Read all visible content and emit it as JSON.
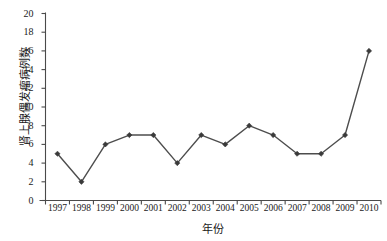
{
  "chart_data": {
    "type": "line",
    "title": "",
    "xlabel": "年份",
    "ylabel": "肾上腺偶发瘤病例数",
    "categories": [
      "1997",
      "1998",
      "1999",
      "2000",
      "2001",
      "2002",
      "2003",
      "2004",
      "2005",
      "2006",
      "2007",
      "2008",
      "2009",
      "2010"
    ],
    "values": [
      5,
      2,
      6,
      7,
      7,
      4,
      7,
      6,
      8,
      7,
      5,
      5,
      7,
      16
    ],
    "series": [
      {
        "name": "肾上腺偶发瘤病例数",
        "values": [
          5,
          2,
          6,
          7,
          7,
          4,
          7,
          6,
          8,
          7,
          5,
          5,
          7,
          16
        ]
      }
    ],
    "ylim": [
      0,
      20
    ],
    "yticks": [
      0,
      2,
      4,
      6,
      8,
      10,
      12,
      14,
      16,
      18,
      20
    ],
    "ytick_labels": [
      "0",
      "2",
      "4",
      "6",
      "8",
      "10",
      "12",
      "14",
      "16",
      "18",
      "20"
    ],
    "xtick_labels": [
      "1997",
      "1998",
      "1999",
      "2000",
      "2001",
      "2002",
      "2003",
      "2004",
      "2005",
      "2006",
      "2007",
      "2008",
      "2009",
      "2010"
    ],
    "grid": false,
    "legend": "none",
    "marker": "diamond",
    "line_color": "#4d4d4d",
    "marker_color": "#3a3a3a",
    "axis_color": "#4a4a4a",
    "background_color": "#ffffff"
  },
  "axes": {
    "y_label_text": "肾上腺偶发瘤病例数",
    "x_label_text": "年份"
  }
}
